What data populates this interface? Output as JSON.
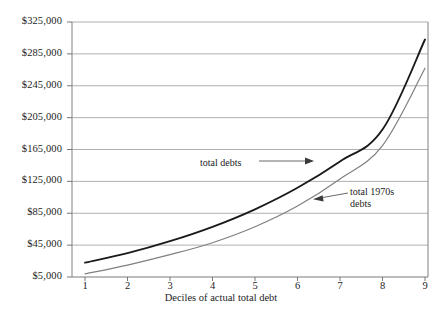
{
  "chart_data": {
    "type": "line",
    "title": "",
    "xlabel": "Deciles of actual total debt",
    "ylabel": "",
    "x": [
      1,
      2,
      3,
      4,
      5,
      6,
      7,
      8,
      9
    ],
    "xtick_labels": [
      "1",
      "2",
      "3",
      "4",
      "5",
      "6",
      "7",
      "8",
      "9"
    ],
    "ytick_labels": [
      "$5,000",
      "$45,000",
      "$85,000",
      "$125,000",
      "$165,000",
      "$205,000",
      "$245,000",
      "$285,000",
      "$325,000"
    ],
    "ytick_values": [
      5000,
      45000,
      85000,
      125000,
      165000,
      205000,
      245000,
      285000,
      325000
    ],
    "ylim": [
      5000,
      325000
    ],
    "xlim": [
      1,
      9
    ],
    "grid": "horizontal",
    "legend_position": "inline-annotations",
    "series": [
      {
        "name": "total debts",
        "color": "#1a1a1a",
        "width": 1.9,
        "values": [
          23000,
          35000,
          50000,
          68000,
          90000,
          117000,
          150000,
          190000,
          303000
        ]
      },
      {
        "name": "total 1970s debts",
        "color": "#808080",
        "width": 1.2,
        "values": [
          9000,
          20000,
          33000,
          48000,
          68000,
          94000,
          128000,
          170000,
          267000
        ]
      }
    ],
    "annotations": [
      {
        "id": "ann-total-debts",
        "text": "total debts",
        "x": 200,
        "y": 157
      },
      {
        "id": "ann-total-1970s-debts",
        "text": "total 1970s\ndebts",
        "x": 350,
        "y": 186
      }
    ]
  }
}
